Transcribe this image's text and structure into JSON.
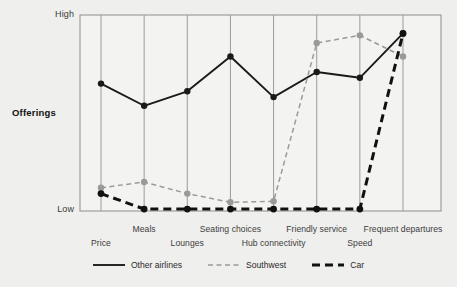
{
  "axes": {
    "y_axis_title": "Offerings",
    "y_high_label": "High",
    "y_low_label": "Low"
  },
  "legend": {
    "items": [
      {
        "label": "Other airlines",
        "style": "solid",
        "color": "#1a1a1a",
        "icon": "solid-line-icon"
      },
      {
        "label": "Southwest",
        "style": "dashed",
        "color": "#9a9a9a",
        "icon": "dashed-line-icon"
      },
      {
        "label": "Car",
        "style": "dashed-thick",
        "color": "#111111",
        "icon": "thick-dashed-line-icon"
      }
    ]
  },
  "chart_data": {
    "type": "line",
    "title": "",
    "xlabel": "",
    "ylabel": "Offerings",
    "ylim": [
      0,
      1
    ],
    "ytick_labels": [
      "Low",
      "High"
    ],
    "grid": "vertical-only",
    "legend_position": "bottom-center",
    "categories": [
      "Price",
      "Meals",
      "Lounges",
      "Seating choices",
      "Hub connectivity",
      "Friendly service",
      "Speed",
      "Frequent departures"
    ],
    "series": [
      {
        "name": "Other airlines",
        "color": "#1a1a1a",
        "style": "solid",
        "values": [
          0.655,
          0.54,
          0.615,
          0.795,
          0.585,
          0.715,
          0.685,
          0.915
        ]
      },
      {
        "name": "Southwest",
        "color": "#9a9a9a",
        "style": "dashed",
        "values": [
          0.115,
          0.145,
          0.085,
          0.04,
          0.045,
          0.865,
          0.905,
          0.795
        ]
      },
      {
        "name": "Car",
        "color": "#111111",
        "style": "dashed-thick",
        "values": [
          0.085,
          0.005,
          0.005,
          0.005,
          0.005,
          0.005,
          0.005,
          0.915
        ]
      }
    ]
  }
}
